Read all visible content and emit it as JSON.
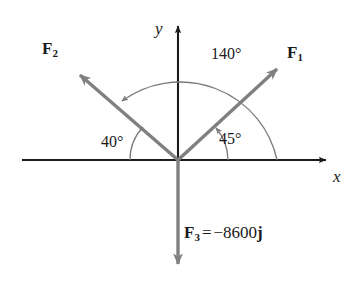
{
  "figure": {
    "type": "force-vector-diagram",
    "axes": {
      "x_label": "x",
      "y_label": "y"
    },
    "colors": {
      "vector": "#808080",
      "axis": "#1a1a1a",
      "arc": "#7a7a7a",
      "text": "#1a1a1a",
      "background": "#ffffff"
    },
    "vectors": [
      {
        "id": "F1",
        "name": "F",
        "subscript": "1",
        "angle_from_positive_x_deg": 45,
        "label": "F₁"
      },
      {
        "id": "F2",
        "name": "F",
        "subscript": "2",
        "angle_from_positive_x_deg": 140,
        "label": "F₂"
      },
      {
        "id": "F3",
        "name": "F",
        "subscript": "3",
        "angle_from_positive_x_deg": 270,
        "label": "F₃"
      }
    ],
    "angles": [
      {
        "id": "angle-140",
        "value": "140°",
        "between": "F1-to-F2"
      },
      {
        "id": "angle-45",
        "value": "45°",
        "between": "x-axis-to-F1"
      },
      {
        "id": "angle-40",
        "value": "40°",
        "between": "negative-x-axis-to-F2"
      }
    ],
    "equation": {
      "lhs_symbol": "F",
      "lhs_subscript": "3",
      "operator": "=",
      "sign": "−",
      "magnitude": "8600",
      "unit_vector": "j",
      "full_text": "F₃ = −8600j"
    }
  }
}
